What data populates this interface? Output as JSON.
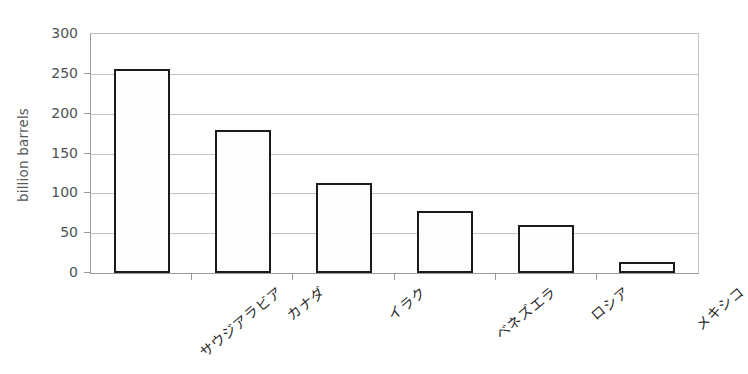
{
  "chart_data": {
    "type": "bar",
    "title": "",
    "subtitle": "",
    "xlabel": "",
    "ylabel": "billion barrels",
    "categories": [
      "サウジアラビア",
      "カナダ",
      "イラク",
      "ベネズエラ",
      "ロシア",
      "メキシコ"
    ],
    "values": [
      256,
      180,
      113,
      78,
      60,
      14
    ],
    "series": [
      {
        "name": "proven oil reserves",
        "values": [
          256,
          180,
          113,
          78,
          60,
          14
        ]
      }
    ],
    "ylim": [
      0,
      300
    ],
    "yticks": [
      0,
      50,
      100,
      150,
      200,
      250,
      300
    ],
    "ytick_labels": [
      "0",
      "50",
      "100",
      "150",
      "200",
      "250",
      "300"
    ],
    "grid": true,
    "legend": false,
    "legend_position": "none",
    "bar_fill_color": "#fdfdfd",
    "bar_edge_color": "#1b1b1b",
    "gridline_color": "#c4c4c4",
    "axis_color": "#9a9a9a",
    "background_color": "#ffffff",
    "xlabel_rotation": -40
  }
}
